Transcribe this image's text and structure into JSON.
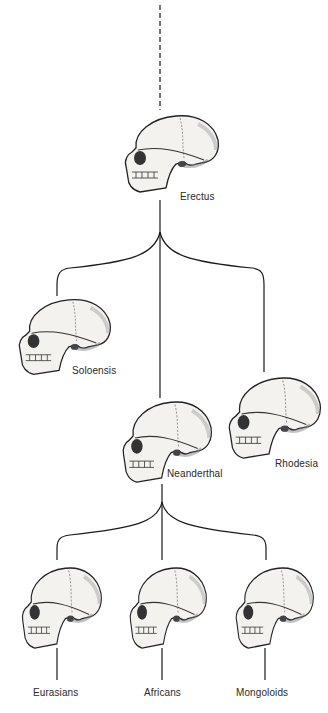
{
  "diagram": {
    "type": "phylogenetic-tree",
    "colors": {
      "line": "#1a1a1a",
      "ink": "#222222",
      "bone": "#f4f2ee",
      "shade": "#9a9a9a",
      "background": "#ffffff"
    },
    "root": {
      "line_style": "dashed"
    },
    "nodes": [
      {
        "id": "erectus",
        "label": "Erectus",
        "level": 0
      },
      {
        "id": "soloensis",
        "label": "Soloensis",
        "level": 1,
        "parent": "erectus"
      },
      {
        "id": "neanderthal",
        "label": "Neanderthal",
        "level": 1,
        "parent": "erectus"
      },
      {
        "id": "rhodesia",
        "label": "Rhodesia",
        "level": 1,
        "parent": "erectus"
      },
      {
        "id": "eurasians",
        "label": "Eurasians",
        "level": 2,
        "parent": "neanderthal"
      },
      {
        "id": "africans",
        "label": "Africans",
        "level": 2,
        "parent": "neanderthal"
      },
      {
        "id": "mongoloids",
        "label": "Mongoloids",
        "level": 2,
        "parent": "neanderthal"
      }
    ]
  }
}
